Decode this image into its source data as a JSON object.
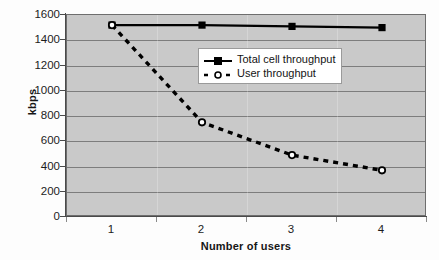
{
  "chart_data": {
    "type": "line",
    "title": "",
    "xlabel": "Number of users",
    "ylabel": "kbps",
    "categories": [
      "1",
      "2",
      "3",
      "4"
    ],
    "xtick_labels": [
      "1",
      "2",
      "3",
      "4"
    ],
    "ytick_labels": [
      "0",
      "200",
      "400",
      "600",
      "800",
      "1000",
      "1200",
      "1400",
      "1600"
    ],
    "ylim": [
      0,
      1600
    ],
    "ytick_step": 200,
    "grid": "horizontal",
    "legend_position": "upper-right-inside",
    "plot_background": "#c9c9c9",
    "series": [
      {
        "name": "Total cell throughput",
        "values": [
          1520,
          1520,
          1510,
          1500
        ],
        "color": "#000000",
        "line_style": "solid",
        "marker": "filled-square"
      },
      {
        "name": "User throughput",
        "values": [
          1520,
          750,
          490,
          370
        ],
        "color": "#000000",
        "line_style": "dashed",
        "marker": "open-circle"
      }
    ]
  },
  "legend": {
    "entries": [
      {
        "label": "Total cell throughput"
      },
      {
        "label": "User throughput"
      }
    ]
  }
}
